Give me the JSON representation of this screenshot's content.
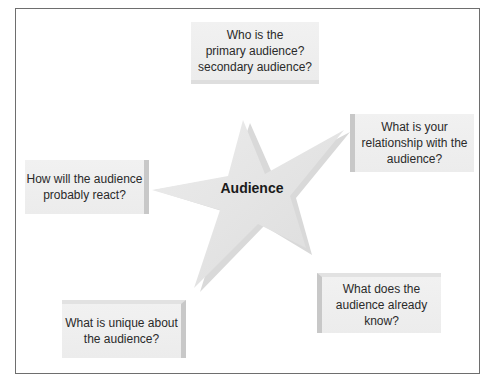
{
  "diagram": {
    "center": {
      "label": "Audience",
      "shape": "star"
    },
    "questions": [
      {
        "id": "primary-secondary",
        "lines": [
          "Who is the",
          "primary audience?",
          "secondary audience?"
        ]
      },
      {
        "id": "relationship",
        "lines": [
          "What is your",
          "relationship with the",
          "audience?"
        ]
      },
      {
        "id": "already-know",
        "lines": [
          "What does the",
          "audience already",
          "know?"
        ]
      },
      {
        "id": "unique",
        "lines": [
          "What is unique about",
          "the audience?"
        ]
      },
      {
        "id": "react",
        "lines": [
          "How will the audience",
          "probably react?"
        ]
      }
    ],
    "colors": {
      "box_fill": "#efefef",
      "box_edge": "#c8c8c8",
      "star_fill": "#e6e6e6",
      "frame": "#6e6e6e",
      "text": "#2a2a2a"
    }
  }
}
